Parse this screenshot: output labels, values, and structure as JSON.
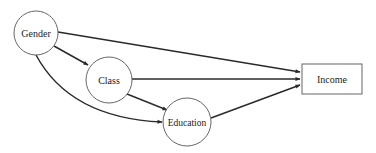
{
  "diagram": {
    "type": "path-diagram",
    "nodes": [
      {
        "id": "gender",
        "label": "Gender",
        "shape": "circle",
        "cx": 36,
        "cy": 33,
        "r": 22
      },
      {
        "id": "class",
        "label": "Class",
        "shape": "circle",
        "cx": 109,
        "cy": 80,
        "r": 23
      },
      {
        "id": "education",
        "label": "Education",
        "shape": "circle",
        "cx": 187,
        "cy": 122,
        "r": 24
      },
      {
        "id": "income",
        "label": "Income",
        "shape": "rect",
        "x": 302,
        "y": 64,
        "width": 60,
        "height": 30
      }
    ],
    "edges": [
      {
        "from": "gender",
        "to": "income"
      },
      {
        "from": "gender",
        "to": "class"
      },
      {
        "from": "gender",
        "to": "education",
        "curved": true
      },
      {
        "from": "class",
        "to": "income"
      },
      {
        "from": "class",
        "to": "education"
      },
      {
        "from": "education",
        "to": "income"
      }
    ],
    "colors": {
      "line": "#2a2a2a",
      "node_border": "#555555",
      "background": "#ffffff"
    }
  }
}
